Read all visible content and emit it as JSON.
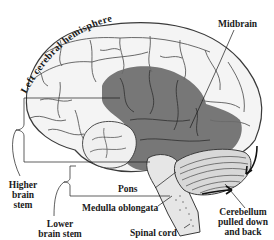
{
  "diagram": {
    "labels": {
      "hemisphere": "Left cerebral hemisphere",
      "midbrain": "Midbrain",
      "higher_brain_stem": [
        "Higher",
        "brain",
        "stem"
      ],
      "pons": "Pons",
      "medulla": "Medulla oblongata",
      "lower_brain_stem": [
        "Lower",
        "brain stem"
      ],
      "spinal_cord": "Spinal cord",
      "cerebellum": [
        "Cerebellum",
        "pulled down",
        "and back"
      ]
    },
    "colors": {
      "line": "#1a1a1a",
      "cortex_fill": "#f4f4f4",
      "cortex_stroke": "#3a3a3a",
      "shaded_region": "#6b6b6b",
      "cerebellum_fill": "#d8d8d8",
      "stem_fill": "#e6e6e6",
      "background": "#ffffff"
    },
    "arrows": [
      {
        "name": "cerebellum-down-arrow",
        "direction": "down"
      },
      {
        "name": "cerebellum-back-arrow",
        "direction": "right"
      }
    ]
  }
}
